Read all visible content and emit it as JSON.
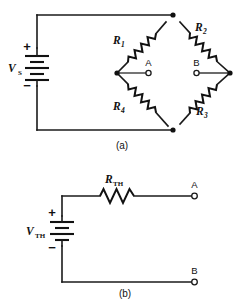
{
  "figure": {
    "background_color": "#ffffff",
    "line_color": "#1a1a1a"
  },
  "circuit_a": {
    "caption": "(a)",
    "source": {
      "label_main": "V",
      "label_sub": "S",
      "plus_sign": "+",
      "minus_sign": "−",
      "type": "dc-voltage-source"
    },
    "resistors": [
      {
        "id": "R1",
        "label_main": "R",
        "label_sub": "1",
        "position": "upper-left-branch"
      },
      {
        "id": "R2",
        "label_main": "R",
        "label_sub": "2",
        "position": "upper-right-branch"
      },
      {
        "id": "R3",
        "label_main": "R",
        "label_sub": "3",
        "position": "lower-right-branch"
      },
      {
        "id": "R4",
        "label_main": "R",
        "label_sub": "4",
        "position": "lower-left-branch"
      }
    ],
    "terminals": [
      {
        "id": "A",
        "label": "A",
        "position": "bridge-left-output"
      },
      {
        "id": "B",
        "label": "B",
        "position": "bridge-right-output"
      }
    ]
  },
  "circuit_b": {
    "caption": "(b)",
    "source": {
      "label_main": "V",
      "label_sub": "TH",
      "plus_sign": "+",
      "minus_sign": "−",
      "type": "dc-voltage-source"
    },
    "resistors": [
      {
        "id": "RTH",
        "label_main": "R",
        "label_sub": "TH",
        "position": "series-top"
      }
    ],
    "terminals": [
      {
        "id": "A",
        "label": "A",
        "position": "top-right-output"
      },
      {
        "id": "B",
        "label": "B",
        "position": "bottom-right-output"
      }
    ]
  }
}
